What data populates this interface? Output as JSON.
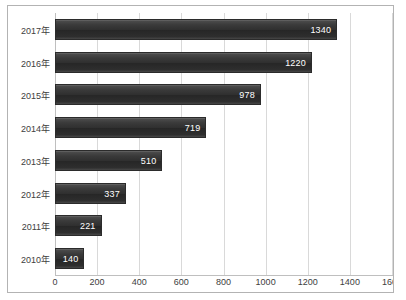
{
  "chart_data": {
    "type": "bar",
    "orientation": "horizontal",
    "title": "",
    "xlabel": "",
    "ylabel": "",
    "categories": [
      "2017年",
      "2016年",
      "2015年",
      "2014年",
      "2013年",
      "2012年",
      "2011年",
      "2010年"
    ],
    "values": [
      1340,
      1220,
      978,
      719,
      510,
      337,
      221,
      140
    ],
    "data_labels": [
      "1340",
      "1220",
      "978",
      "719",
      "510",
      "337",
      "221",
      "140"
    ],
    "xlim": [
      0,
      1600
    ],
    "xticks": [
      0,
      200,
      400,
      600,
      800,
      1000,
      1200,
      1400,
      1600
    ],
    "xtick_labels": [
      "0",
      "200",
      "400",
      "600",
      "800",
      "1000",
      "1200",
      "1400",
      "1600"
    ],
    "grid": "vertical",
    "legend": "none",
    "bar_color": "#303030",
    "plot_background": "#ffffff",
    "gridline_color": "#d9d9d9",
    "border_color": "#b3b3b3",
    "label_color": "#404040",
    "data_label_color": "#ffffff"
  }
}
